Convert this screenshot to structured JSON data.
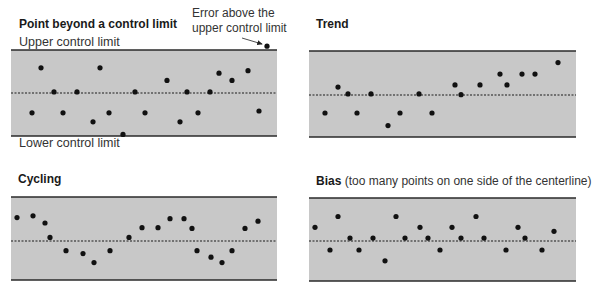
{
  "labels": {
    "upper_control_limit": "Upper control limit",
    "lower_control_limit": "Lower control limit",
    "annotation_line1": "Error above the",
    "annotation_line2": "upper control limit"
  },
  "panels": [
    {
      "title": "Point beyond a control limit",
      "subtitle": ""
    },
    {
      "title": "Trend",
      "subtitle": ""
    },
    {
      "title": "Cycling",
      "subtitle": ""
    },
    {
      "title": "Bias",
      "subtitle": " (too many points on one side of the centerline)"
    }
  ],
  "colors": {
    "band_fill": "#c8c8c8",
    "limit_line": "#2a2a2a",
    "centerline": "#1a1a1a",
    "point": "#111111"
  },
  "chart_data": [
    {
      "type": "scatter",
      "title": "Point beyond a control limit",
      "ylabel": "",
      "xlabel": "",
      "annotations": [
        "Upper control limit",
        "Lower control limit",
        "Error above the upper control limit"
      ],
      "y_range": [
        -1,
        1
      ],
      "centerline": 0,
      "upper_limit": 1,
      "lower_limit": -1,
      "points": [
        [
          32,
          -0.55
        ],
        [
          41,
          0.7
        ],
        [
          54,
          0.03
        ],
        [
          63,
          -0.55
        ],
        [
          77,
          0.03
        ],
        [
          93,
          -0.8
        ],
        [
          100,
          0.7
        ],
        [
          109,
          -0.55
        ],
        [
          123,
          -1.15
        ],
        [
          135,
          0.03
        ],
        [
          145,
          -0.55
        ],
        [
          167,
          0.35
        ],
        [
          180,
          -0.8
        ],
        [
          187,
          0.03
        ],
        [
          198,
          -0.55
        ],
        [
          210,
          0.03
        ],
        [
          219,
          0.55
        ],
        [
          232,
          0.35
        ],
        [
          248,
          0.62
        ],
        [
          259,
          -0.5
        ],
        [
          267,
          1.3
        ]
      ]
    },
    {
      "type": "scatter",
      "title": "Trend",
      "y_range": [
        -1,
        1
      ],
      "centerline": 0,
      "upper_limit": 1,
      "lower_limit": -1,
      "points": [
        [
          325,
          -0.5
        ],
        [
          338,
          0.22
        ],
        [
          348,
          0.03
        ],
        [
          357,
          -0.5
        ],
        [
          371,
          0.03
        ],
        [
          388,
          -0.85
        ],
        [
          400,
          -0.5
        ],
        [
          419,
          0.03
        ],
        [
          432,
          -0.5
        ],
        [
          455,
          0.28
        ],
        [
          461,
          0.01
        ],
        [
          480,
          0.28
        ],
        [
          500,
          0.58
        ],
        [
          507,
          0.28
        ],
        [
          522,
          0.58
        ],
        [
          535,
          0.58
        ],
        [
          558,
          0.9
        ]
      ]
    },
    {
      "type": "scatter",
      "title": "Cycling",
      "y_range": [
        -1,
        1
      ],
      "centerline": 0,
      "upper_limit": 1,
      "lower_limit": -1,
      "points": [
        [
          17,
          0.65
        ],
        [
          33,
          0.7
        ],
        [
          45,
          0.5
        ],
        [
          50,
          0.1
        ],
        [
          66,
          -0.27
        ],
        [
          83,
          -0.35
        ],
        [
          94,
          -0.6
        ],
        [
          110,
          -0.27
        ],
        [
          129,
          0.1
        ],
        [
          142,
          0.37
        ],
        [
          158,
          0.37
        ],
        [
          170,
          0.62
        ],
        [
          184,
          0.62
        ],
        [
          192,
          0.35
        ],
        [
          197,
          -0.27
        ],
        [
          211,
          -0.45
        ],
        [
          222,
          -0.6
        ],
        [
          232,
          -0.27
        ],
        [
          245,
          0.35
        ],
        [
          258,
          0.55
        ]
      ]
    },
    {
      "type": "scatter",
      "title": "Bias (too many points on one side of the centerline)",
      "y_range": [
        -1,
        1
      ],
      "centerline": 0,
      "upper_limit": 1,
      "lower_limit": -1,
      "points": [
        [
          315,
          0.38
        ],
        [
          330,
          -0.25
        ],
        [
          338,
          0.68
        ],
        [
          350,
          0.08
        ],
        [
          359,
          -0.25
        ],
        [
          373,
          0.08
        ],
        [
          385,
          -0.55
        ],
        [
          396,
          0.68
        ],
        [
          405,
          0.08
        ],
        [
          420,
          0.38
        ],
        [
          428,
          0.08
        ],
        [
          440,
          -0.25
        ],
        [
          452,
          0.38
        ],
        [
          461,
          0.08
        ],
        [
          476,
          0.68
        ],
        [
          484,
          0.08
        ],
        [
          506,
          -0.25
        ],
        [
          518,
          0.38
        ],
        [
          525,
          0.08
        ],
        [
          542,
          -0.25
        ],
        [
          554,
          0.27
        ]
      ]
    }
  ]
}
